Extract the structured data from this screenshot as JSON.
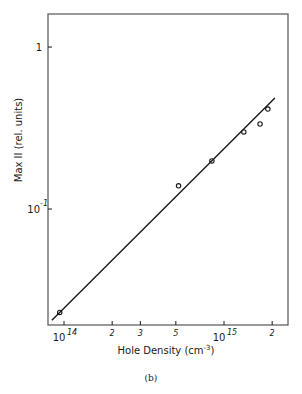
{
  "chart_data": {
    "type": "scatter",
    "title": "",
    "caption": "(b)",
    "xlabel": "Hole Density (cm⁻³)",
    "ylabel": "Max II (rel. units)",
    "xscale": "log",
    "yscale": "log",
    "xlim": [
      79000000000000.0,
      2500000000000000.0
    ],
    "ylim": [
      0.019,
      1.6
    ],
    "grid": false,
    "legend": null,
    "x_ticks": [
      {
        "value": 100000000000000.0,
        "label": "10",
        "exponent": "14",
        "major": true
      },
      {
        "value": 200000000000000.0,
        "label": "2",
        "major": false
      },
      {
        "value": 300000000000000.0,
        "label": "3",
        "major": false
      },
      {
        "value": 500000000000000.0,
        "label": "5",
        "major": false
      },
      {
        "value": 1000000000000000.0,
        "label": "10",
        "exponent": "15",
        "major": true
      },
      {
        "value": 2000000000000000.0,
        "label": "2",
        "major": false
      }
    ],
    "y_ticks": [
      {
        "value": 1,
        "label": "1",
        "exponent": ""
      },
      {
        "value": 0.1,
        "label": "10",
        "exponent": "-1"
      }
    ],
    "series": [
      {
        "name": "measured",
        "marker": "open-circle",
        "x": [
          94000000000000.0,
          520000000000000.0,
          840000000000000.0,
          1330000000000000.0,
          1680000000000000.0,
          1880000000000000.0
        ],
        "y": [
          0.023,
          0.139,
          0.198,
          0.299,
          0.335,
          0.414
        ]
      },
      {
        "name": "fit",
        "style": "line",
        "x": [
          84000000000000.0,
          2080000000000000.0
        ],
        "y": [
          0.0206,
          0.484
        ]
      }
    ]
  },
  "plot": {
    "frame": {
      "left": 48,
      "top": 14,
      "right": 288,
      "bottom": 325
    },
    "x_log_min": 13.9,
    "x_log_max": 15.4,
    "y_log_min": -1.716,
    "y_log_max": 0.204,
    "colors": {
      "ink": "#1a1a1a",
      "frame": "#555555"
    }
  },
  "labels": {
    "xlabel_main": "Hole Density (cm",
    "xlabel_sup": "-3",
    "xlabel_end": ")",
    "ylabel": "Max II (rel. units)",
    "caption": "(b)"
  }
}
